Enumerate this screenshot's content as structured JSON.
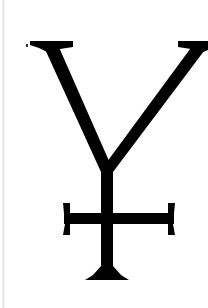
{
  "image": {
    "kind": "symbol-illustration",
    "title": "Alchemical Y-with-cross symbol",
    "background_color": "#ffffff",
    "ink_color": "#000000",
    "width": 208,
    "height": 308,
    "text_content": ""
  },
  "symbol": {
    "name": "y-cross-glyph",
    "description": "Serifed V forming a Y over a vertical stem crossed by a horizontal bar with flared end caps and a flared foot",
    "parts": [
      {
        "id": "left-arm",
        "label": "left diagonal arm"
      },
      {
        "id": "right-arm",
        "label": "right diagonal arm"
      },
      {
        "id": "left-top-serif",
        "label": "left top serif"
      },
      {
        "id": "right-top-serif",
        "label": "right top serif"
      },
      {
        "id": "vertical-stem",
        "label": "vertical stem"
      },
      {
        "id": "cross-bar",
        "label": "horizontal cross bar"
      },
      {
        "id": "left-bar-cap",
        "label": "left bar end cap"
      },
      {
        "id": "right-bar-cap",
        "label": "right bar end cap"
      },
      {
        "id": "base-foot",
        "label": "flared base foot"
      }
    ]
  },
  "artifacts": {
    "left_edge_line": "faint vertical scan line",
    "speck": "small dark speck near upper left"
  }
}
